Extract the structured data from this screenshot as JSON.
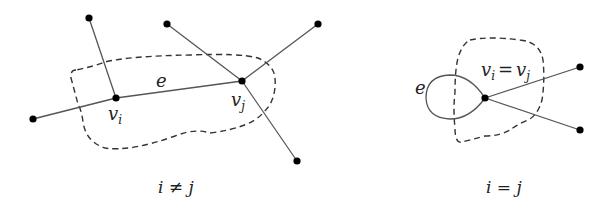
{
  "left_diagram": {
    "caption": "i ≠ j",
    "edge_label": "e",
    "vertex_i_label": "v",
    "vertex_i_sub": "i",
    "vertex_j_label": "v",
    "vertex_j_sub": "j"
  },
  "right_diagram": {
    "caption": "i = j",
    "edge_label": "e",
    "vertex_label": "v",
    "vertex_sub_1": "i",
    "equals": "=",
    "vertex_sub_2": "j"
  },
  "colors": {
    "edge": "#555555",
    "node": "#000000",
    "boundary": "#333333",
    "text": "#222222"
  }
}
